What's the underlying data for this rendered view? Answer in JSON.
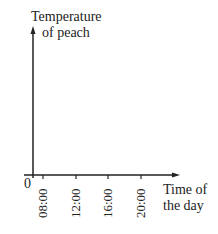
{
  "chart_data": {
    "type": "line",
    "title": "",
    "ylabel": "Temperature of peach",
    "xlabel": "Time of the day",
    "origin_label": "0",
    "xticks": [
      "08:00",
      "12:00",
      "16:00",
      "20:00"
    ],
    "series": []
  },
  "labels": {
    "y_line1": "Temperature",
    "y_line2": "of peach",
    "x_line1": "Time of",
    "x_line2": "the day",
    "origin": "0"
  }
}
